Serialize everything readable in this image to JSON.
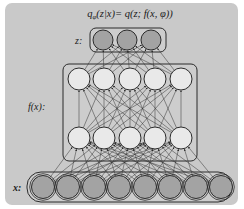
{
  "diagram": {
    "title_parts": {
      "q": "q",
      "phi_sub": "φ",
      "rest": "(z|x)= q(z; f(x, φ))"
    },
    "labels": {
      "z": "z:",
      "fx": "f(x):",
      "x": "x:"
    },
    "layers": [
      {
        "name": "z",
        "nodes": 3,
        "fill": "#a3a3a3"
      },
      {
        "name": "hidden-upper",
        "nodes": 5,
        "fill": "#e9e9e9"
      },
      {
        "name": "hidden-lower",
        "nodes": 5,
        "fill": "#e9e9e9"
      },
      {
        "name": "x",
        "nodes": 8,
        "fill": "#a3a3a3"
      }
    ],
    "colors": {
      "panel": "#c9c9c9",
      "stroke": "#2b2b2b",
      "box_fill": "#cdcdcd",
      "edge": "#333333"
    }
  }
}
